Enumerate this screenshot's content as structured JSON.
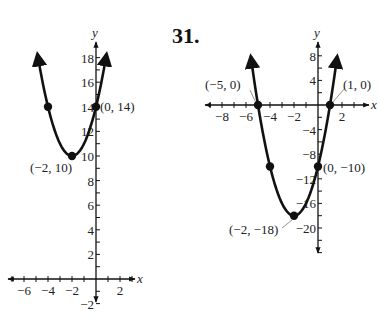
{
  "problem_number": "31.",
  "chart_data": [
    {
      "type": "line",
      "title": "",
      "function": "y = (x + 2)^2 + 10",
      "xlabel": "x",
      "ylabel": "y",
      "xlim": [
        -7,
        3
      ],
      "ylim": [
        -2.5,
        18.5
      ],
      "grid": false,
      "x_ticks": [
        -6,
        -4,
        -2,
        2
      ],
      "y_ticks": [
        -2,
        2,
        4,
        6,
        8,
        10,
        12,
        14,
        16,
        18
      ],
      "points": [
        {
          "x": -4,
          "y": 14,
          "label": ""
        },
        {
          "x": -2,
          "y": 10,
          "label": "(−2, 10)"
        },
        {
          "x": 0,
          "y": 14,
          "label": "(0, 14)"
        }
      ],
      "vertex": {
        "x": -2,
        "y": 10
      }
    },
    {
      "type": "line",
      "title": "",
      "function": "y = 2(x + 2)^2 − 18",
      "xlabel": "x",
      "ylabel": "y",
      "xlim": [
        -9,
        3
      ],
      "ylim": [
        -24,
        9
      ],
      "grid": false,
      "x_ticks": [
        -8,
        -6,
        -4,
        -2,
        2
      ],
      "y_ticks": [
        8,
        4,
        -4,
        -8,
        -12,
        -16,
        -20
      ],
      "points": [
        {
          "x": -5,
          "y": 0,
          "label": "(−5, 0)"
        },
        {
          "x": 1,
          "y": 0,
          "label": "(1, 0)"
        },
        {
          "x": -4,
          "y": -10,
          "label": ""
        },
        {
          "x": 0,
          "y": -10,
          "label": "(0, −10)"
        },
        {
          "x": -2,
          "y": -18,
          "label": "(−2, −18)"
        }
      ],
      "vertex": {
        "x": -2,
        "y": -18
      }
    }
  ],
  "graphs": {
    "left": {
      "x_axis_label": "x",
      "y_axis_label": "y",
      "x_tick_labels": [
        "−6",
        "−4",
        "−2",
        "2"
      ],
      "y_tick_labels": [
        "−2",
        "2",
        "4",
        "6",
        "8",
        "10",
        "12",
        "14",
        "16",
        "18"
      ],
      "point_labels": {
        "vertex": "(−2, 10)",
        "y_intercept": "(0, 14)"
      }
    },
    "right": {
      "x_axis_label": "x",
      "y_axis_label": "y",
      "x_tick_labels": [
        "−8",
        "−6",
        "−4",
        "−2",
        "2"
      ],
      "y_tick_labels": [
        "8",
        "4",
        "−4",
        "−8",
        "−12",
        "−16",
        "−20"
      ],
      "point_labels": {
        "x_int_left": "(−5, 0)",
        "x_int_right": "(1, 0)",
        "y_intercept": "(0, −10)",
        "vertex": "(−2, −18)"
      }
    }
  },
  "colors": {
    "ink": "#111111",
    "leader": "#777777"
  }
}
